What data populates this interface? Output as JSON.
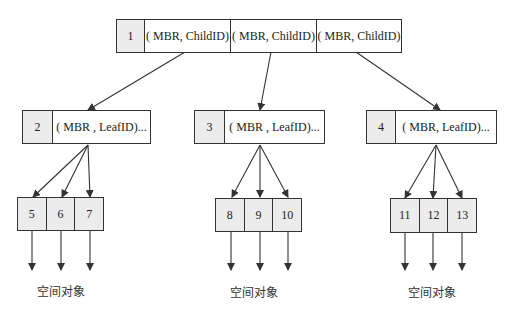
{
  "root": {
    "id": "1",
    "entries": [
      "( MBR, ChildID)",
      "( MBR, ChildID)",
      "( MBR, ChildID)"
    ]
  },
  "internal_nodes": [
    {
      "id": "2",
      "entry": "( MBR , LeafID)..."
    },
    {
      "id": "3",
      "entry": "( MBR , LeafID)..."
    },
    {
      "id": "4",
      "entry": "( MBR, LeafID)..."
    }
  ],
  "leaf_groups": [
    {
      "ids": [
        "5",
        "6",
        "7"
      ],
      "label": "空间对象"
    },
    {
      "ids": [
        "8",
        "9",
        "10"
      ],
      "label": "空间对象"
    },
    {
      "ids": [
        "11",
        "12",
        "13"
      ],
      "label": "空间对象"
    }
  ],
  "colors": {
    "line": "#333333",
    "shade": "#ececec"
  }
}
